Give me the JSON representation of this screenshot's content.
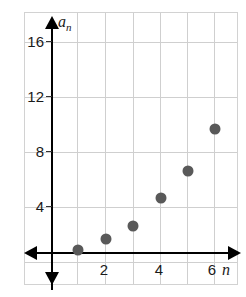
{
  "chart_data": {
    "type": "scatter",
    "title": "",
    "xlabel": "n",
    "ylabel": "a_n",
    "x": [
      1,
      2,
      3,
      4,
      5,
      6
    ],
    "values": [
      0.2,
      1,
      2,
      4,
      6,
      9
    ],
    "points": [
      {
        "x": 1,
        "y": 0.2
      },
      {
        "x": 2,
        "y": 1
      },
      {
        "x": 3,
        "y": 2
      },
      {
        "x": 4,
        "y": 4
      },
      {
        "x": 5,
        "y": 6
      },
      {
        "x": 6,
        "y": 9
      }
    ],
    "xlim": [
      -0.85,
      7.4
    ],
    "ylim": [
      -2.0,
      19.8
    ],
    "x_ticks": [
      2,
      4,
      6
    ],
    "x_tick_labels": [
      "2",
      "4",
      "6"
    ],
    "y_ticks": [
      4,
      8,
      12,
      16
    ],
    "y_tick_labels": [
      "4",
      "8",
      "12",
      "16"
    ],
    "x_gridlines": [
      1,
      2,
      3,
      4,
      5,
      6
    ],
    "y_gridlines": [
      4,
      8,
      12,
      16
    ],
    "grid": true,
    "legend": null,
    "point_color": "#595959",
    "grid_color": "#cfcfcf",
    "axis_color": "#000000",
    "frame_color": "#d2d2d2"
  },
  "axis_titles": {
    "y_base": "a",
    "y_sub": "n",
    "x": "n"
  }
}
